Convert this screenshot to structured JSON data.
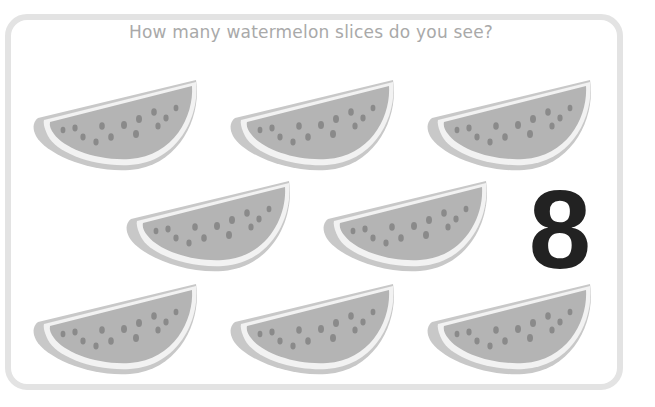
{
  "question": "How many watermelon slices do you see?",
  "answer_number": "8",
  "slice_count": 8,
  "colors": {
    "flesh": "#b4b4b4",
    "rind_white": "#f2f2f2",
    "rind_outer": "#c8c8c8",
    "seed": "#8a8a8a",
    "number": "#222222",
    "card_border": "#e3e3e3",
    "title_text": "#a9a9a9"
  },
  "slices": [
    {
      "id": 1,
      "x": 30,
      "y": 76
    },
    {
      "id": 2,
      "x": 227,
      "y": 76
    },
    {
      "id": 3,
      "x": 424,
      "y": 76
    },
    {
      "id": 4,
      "x": 123,
      "y": 177
    },
    {
      "id": 5,
      "x": 320,
      "y": 177
    },
    {
      "id": 6,
      "x": 30,
      "y": 280
    },
    {
      "id": 7,
      "x": 227,
      "y": 280
    },
    {
      "id": 8,
      "x": 424,
      "y": 280
    }
  ]
}
